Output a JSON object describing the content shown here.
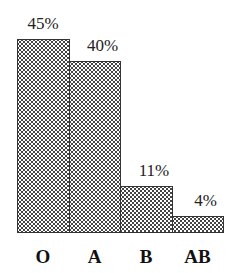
{
  "chart_data": {
    "type": "bar",
    "title": "",
    "xlabel": "",
    "ylabel": "",
    "categories": [
      "O",
      "A",
      "B",
      "AB"
    ],
    "values": [
      45,
      40,
      11,
      4
    ],
    "value_labels": [
      "45%",
      "40%",
      "11%",
      "4%"
    ],
    "unit": "%",
    "ylim": [
      0,
      45
    ],
    "grid": false,
    "legend": "none",
    "bar_style": "dotted fill, no gaps between bars"
  }
}
